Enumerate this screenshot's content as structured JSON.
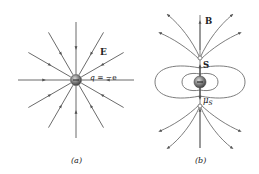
{
  "panels": [
    {
      "id": "a",
      "caption": "(a)",
      "title": "Electric field of electron",
      "labels": {
        "field": "E",
        "charge_q": "q",
        "charge_eq": " = −e"
      },
      "center": [
        76,
        80
      ],
      "line_angles_deg": [
        0,
        30,
        60,
        90,
        120,
        150,
        180,
        210,
        240,
        270,
        300,
        330
      ],
      "line_direction": "inward",
      "colors": {
        "line": "#5a5a5a",
        "charge": "#7a7a7a"
      }
    },
    {
      "id": "b",
      "caption": "(b)",
      "title": "Magnetic dipole field of electron spin",
      "labels": {
        "field": "B",
        "spin": "S",
        "moment": "μ",
        "moment_sub": "S",
        "charge_sign": "−"
      },
      "center": [
        200,
        82
      ],
      "colors": {
        "line": "#6e6e6e",
        "charge": "#7a7a7a"
      }
    }
  ]
}
